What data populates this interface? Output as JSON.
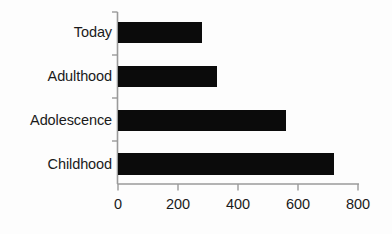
{
  "chart_data": {
    "type": "bar",
    "orientation": "horizontal",
    "title": "",
    "xlabel": "",
    "ylabel": "",
    "categories": [
      "Today",
      "Adulthood",
      "Adolescence",
      "Childhood"
    ],
    "values": [
      280,
      330,
      560,
      720
    ],
    "series": [
      {
        "name": "",
        "values": [
          280,
          330,
          560,
          720
        ]
      }
    ],
    "xlim": [
      0,
      800
    ],
    "xticks": [
      0,
      200,
      400,
      600,
      800
    ],
    "xtick_labels": [
      "0",
      "200",
      "400",
      "600",
      "800"
    ],
    "grid": false,
    "legend": false,
    "legend_position": "none",
    "bar_color": "#0b0b0b",
    "axis_color": "#9a9a9a",
    "background_color": "#fdfdfd",
    "text_color": "#1a1a1a"
  }
}
